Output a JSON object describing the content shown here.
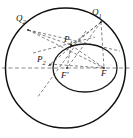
{
  "figure": {
    "background_color": "#ffffff",
    "stroke_color": "#111111",
    "dash_color": "#4a4a4a",
    "width": 133,
    "height": 138
  },
  "labels": {
    "q2": {
      "text": "Q",
      "subscript": "2",
      "x": 16,
      "y": 16
    },
    "q1": {
      "text": "Q",
      "subscript": "1",
      "x": 92,
      "y": 10
    },
    "p1": {
      "text": "P",
      "subscript": "1",
      "x": 64,
      "y": 37
    },
    "p2": {
      "text": "P",
      "subscript": "2",
      "x": 38,
      "y": 57
    },
    "f_prime": {
      "text": "F",
      "prime": "'",
      "x": 62,
      "y": 74
    },
    "f": {
      "text": "F",
      "x": 102,
      "y": 71
    }
  },
  "shapes": {
    "outer_circle": {
      "name": "outer-circle",
      "cx": 65.5,
      "cy": 68,
      "r": 60
    },
    "inner_ellipse": {
      "name": "inner-ellipse",
      "cx": 85,
      "cy": 68,
      "rx": 32,
      "ry": 24
    }
  },
  "points": {
    "Q2": {
      "x": 28,
      "y": 30
    },
    "Q1": {
      "x": 101,
      "y": 22
    },
    "P1": {
      "x": 71,
      "y": 45
    },
    "P2": {
      "x": 51,
      "y": 64
    },
    "F_prime": {
      "x": 67,
      "y": 68
    },
    "F": {
      "x": 104,
      "y": 68
    }
  },
  "axis": {
    "name": "major-axis",
    "x1": 2,
    "y1": 68,
    "x2": 131,
    "y2": 68
  },
  "chords": [
    {
      "name": "chord-q2-f",
      "x1": 28,
      "y1": 30,
      "x2": 104,
      "y2": 68
    },
    {
      "name": "chord-q2-p1",
      "x1": 28,
      "y1": 30,
      "x2": 71,
      "y2": 45
    },
    {
      "name": "chord-q2-q1-extended",
      "x1": 28,
      "y1": 30,
      "x2": 118,
      "y2": 50
    },
    {
      "name": "chord-q1-p2",
      "x1": 101,
      "y1": 22,
      "x2": 51,
      "y2": 64
    },
    {
      "name": "chord-q1-fprime",
      "x1": 101,
      "y1": 22,
      "x2": 67,
      "y2": 68
    },
    {
      "name": "chord-q1-f",
      "x1": 101,
      "y1": 22,
      "x2": 104,
      "y2": 68
    },
    {
      "name": "chord-q1-p1",
      "x1": 101,
      "y1": 22,
      "x2": 71,
      "y2": 45
    },
    {
      "name": "chord-p1-fprime",
      "x1": 71,
      "y1": 45,
      "x2": 67,
      "y2": 68
    },
    {
      "name": "chord-p1-f",
      "x1": 71,
      "y1": 45,
      "x2": 104,
      "y2": 68
    },
    {
      "name": "chord-p2-f",
      "x1": 51,
      "y1": 64,
      "x2": 104,
      "y2": 68
    },
    {
      "name": "chord-transversal-lower-left",
      "x1": 84,
      "y1": 33,
      "x2": 38,
      "y2": 96
    },
    {
      "name": "chord-p2-upper-right",
      "x1": 34,
      "y1": 52,
      "x2": 93,
      "y2": 38
    }
  ]
}
